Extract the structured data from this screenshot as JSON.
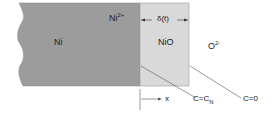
{
  "diagram": {
    "type": "oxidation-schematic",
    "regions": [
      {
        "name": "metal",
        "label": "Ni",
        "color": "#9a9a9a"
      },
      {
        "name": "oxide",
        "label": "NiO",
        "color": "#d8d8d8"
      },
      {
        "name": "gas",
        "label_base": "O",
        "label_sup": "2-"
      }
    ],
    "ion_label": {
      "base": "Ni",
      "sup": "2+"
    },
    "thickness_label": "δ(t)",
    "axis_label": "x",
    "boundary_left": {
      "base": "C=C",
      "sub": "N"
    },
    "boundary_right": "C=0"
  }
}
